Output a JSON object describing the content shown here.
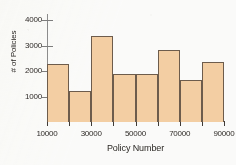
{
  "chart_data": {
    "type": "bar",
    "title": "",
    "subtitle": "",
    "xlabel": "Policy Number",
    "ylabel": "# of Policies",
    "xlim": [
      10000,
      90000
    ],
    "ylim": [
      0,
      4250
    ],
    "grid": false,
    "legend": null,
    "bin_width": 10000,
    "bin_edges": [
      10000,
      20000,
      30000,
      40000,
      50000,
      60000,
      70000,
      80000,
      90000
    ],
    "categories": [
      "10000-20000",
      "20000-30000",
      "30000-40000",
      "40000-50000",
      "50000-60000",
      "60000-70000",
      "70000-80000",
      "80000-90000"
    ],
    "values": [
      2270,
      1230,
      3400,
      1880,
      1890,
      2820,
      1660,
      2350
    ],
    "x_ticks": [
      10000,
      30000,
      50000,
      70000,
      90000
    ],
    "x_tick_labels": [
      "10000",
      "30000",
      "50000",
      "70000",
      "90000"
    ],
    "y_ticks": [
      1000,
      2000,
      3000,
      4000
    ],
    "y_tick_labels": [
      "1000",
      "2000",
      "3000",
      "4000"
    ],
    "colors": {
      "bar_fill": "#f7cfa2",
      "bar_border": "#6d5b4a",
      "axis": "#3f3a35",
      "text": "#221f1c",
      "background": "#fdfdfb"
    }
  }
}
